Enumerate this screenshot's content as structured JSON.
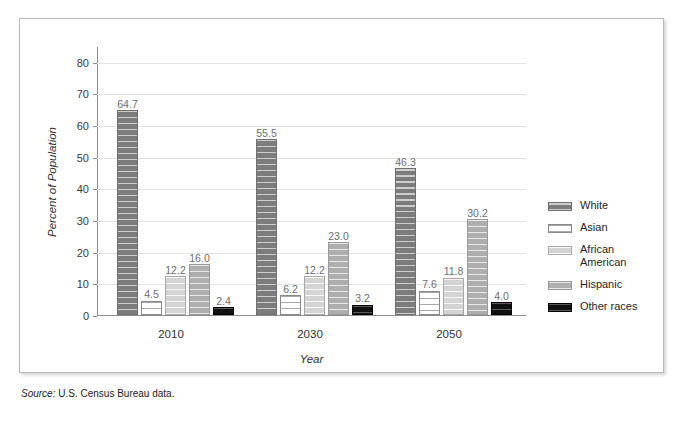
{
  "chart_data": {
    "type": "bar",
    "title": "",
    "subtitle": "",
    "xlabel": "Year",
    "ylabel": "Percent of Population",
    "categories": [
      "2010",
      "2030",
      "2050"
    ],
    "ylim": [
      0,
      85
    ],
    "yticks": [
      0,
      10,
      20,
      30,
      40,
      50,
      60,
      70,
      80
    ],
    "ytick_labels": [
      "0",
      "10",
      "20",
      "30",
      "40",
      "50",
      "60",
      "70",
      "80"
    ],
    "grid": "horizontal",
    "legend_position": "right",
    "value_labels": true,
    "series": [
      {
        "name": "White",
        "values": [
          64.7,
          55.5,
          46.3
        ],
        "labels": [
          "64.7",
          "55.5",
          "46.3"
        ],
        "color": "#7c7c7c",
        "texture": "horizontal-stripes"
      },
      {
        "name": "Asian",
        "values": [
          4.5,
          6.2,
          7.6
        ],
        "labels": [
          "4.5",
          "6.2",
          "7.6"
        ],
        "color": "#ffffff",
        "texture": "horizontal-stripes"
      },
      {
        "name": "African American",
        "values": [
          12.2,
          12.2,
          11.8
        ],
        "labels": [
          "12.2",
          "12.2",
          "11.8"
        ],
        "color": "#d4d4d4",
        "texture": "horizontal-stripes"
      },
      {
        "name": "Hispanic",
        "values": [
          16.0,
          23.0,
          30.2
        ],
        "labels": [
          "16.0",
          "23.0",
          "30.2"
        ],
        "color": "#aeaeae",
        "texture": "horizontal-stripes"
      },
      {
        "name": "Other races",
        "values": [
          2.4,
          3.2,
          4.0
        ],
        "labels": [
          "2.4",
          "3.2",
          "4.0"
        ],
        "color": "#111111",
        "texture": "horizontal-stripes"
      }
    ]
  },
  "legend": {
    "items": [
      {
        "label": "White"
      },
      {
        "label": "Asian"
      },
      {
        "label": "African\nAmerican"
      },
      {
        "label": "Hispanic"
      },
      {
        "label": "Other races"
      }
    ]
  },
  "source": {
    "prefix": "Source:",
    "text": " U.S. Census Bureau data."
  }
}
